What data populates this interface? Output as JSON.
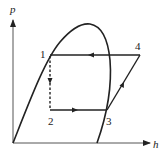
{
  "diagram": {
    "type": "pressure-enthalpy (p-h) refrigeration cycle diagram",
    "axes": {
      "y_label": "p",
      "x_label": "h"
    },
    "points": [
      {
        "id": "1",
        "label": "1"
      },
      {
        "id": "2",
        "label": "2"
      },
      {
        "id": "3",
        "label": "3"
      },
      {
        "id": "4",
        "label": "4"
      }
    ],
    "processes": [
      {
        "from": "4",
        "to": "1",
        "style": "solid",
        "direction": "leftward"
      },
      {
        "from": "1",
        "to": "2",
        "style": "dashed",
        "direction": "downward"
      },
      {
        "from": "2",
        "to": "3",
        "style": "solid",
        "direction": "rightward"
      },
      {
        "from": "3",
        "to": "4",
        "style": "solid",
        "direction": "up-right"
      }
    ],
    "colors": {
      "line": "#222222",
      "background": "#ffffff"
    }
  }
}
